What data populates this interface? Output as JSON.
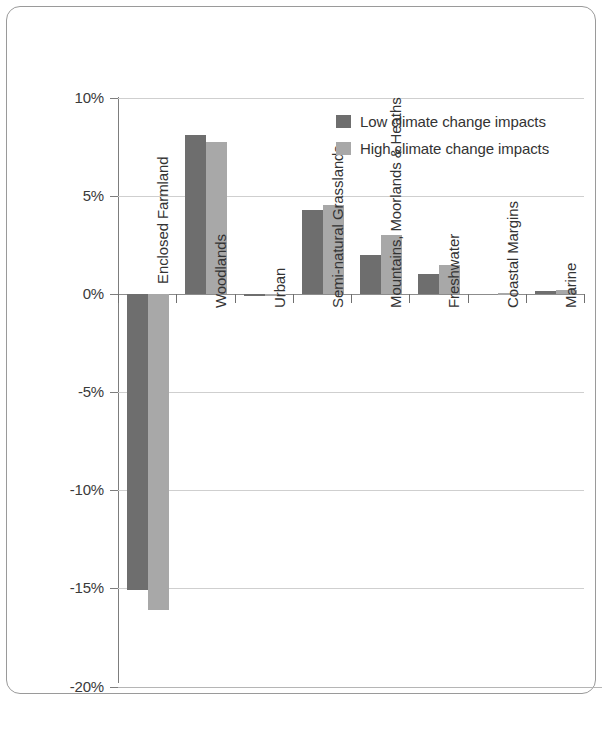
{
  "chart_data": {
    "type": "bar",
    "title": "",
    "subtitle": "",
    "xlabel": "",
    "ylabel": "",
    "grid": true,
    "legend_position": "top-right",
    "ylim": [
      -20,
      10
    ],
    "ytick_labels": [
      "10%",
      "5%",
      "0%",
      "-5%",
      "-10%",
      "-15%",
      "-20%"
    ],
    "ytick_values": [
      10,
      5,
      0,
      -5,
      -10,
      -15,
      -20
    ],
    "categories": [
      "Enclosed Farmland",
      "Woodlands",
      "Urban",
      "Semi-natural Grasslands",
      "Mountains, Moorlands & Heaths",
      "Freshwater",
      "Coastal Margins",
      "Marine"
    ],
    "series": [
      {
        "name": "Low climate change impacts",
        "color": "#6e6e6e",
        "values": [
          -15.1,
          8.1,
          -0.1,
          4.3,
          2.0,
          1.0,
          0.0,
          0.15
        ]
      },
      {
        "name": "High climate change impacts",
        "color": "#a8a8a8",
        "values": [
          -16.1,
          7.75,
          -0.1,
          4.55,
          3.0,
          1.5,
          0.05,
          0.2
        ]
      }
    ]
  },
  "legend": {
    "entries": [
      {
        "label": "Low climate change impacts",
        "swatch": "low"
      },
      {
        "label": "High climate change impacts",
        "swatch": "high"
      }
    ]
  },
  "colors": {
    "low_series": "#6e6e6e",
    "high_series": "#a8a8a8",
    "gridline": "#cfcfcf",
    "axis": "#7d7d7d",
    "frame_border": "#9a9a9a",
    "text": "#333333",
    "background": "#ffffff"
  }
}
